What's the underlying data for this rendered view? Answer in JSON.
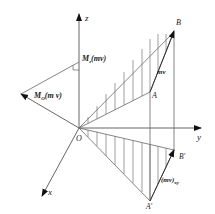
{
  "diagram": {
    "axes": {
      "x": "x",
      "y": "y",
      "z": "z",
      "origin": "O"
    },
    "points": {
      "A": "A",
      "B": "B",
      "A_prime": "A'",
      "B_prime": "B'"
    },
    "vectors": {
      "momentum": "mv",
      "projected_momentum": "(mv)",
      "projected_momentum_sub": "xy",
      "moment_about_O": "M",
      "moment_about_O_sub": "O",
      "moment_about_O_arg": "(m v)",
      "moment_about_z": "M",
      "moment_about_z_sub": "z",
      "moment_about_z_arg": "(mv)"
    },
    "colors": {
      "line": "#555555",
      "arrow": "#111111",
      "hatch": "#666666"
    }
  }
}
